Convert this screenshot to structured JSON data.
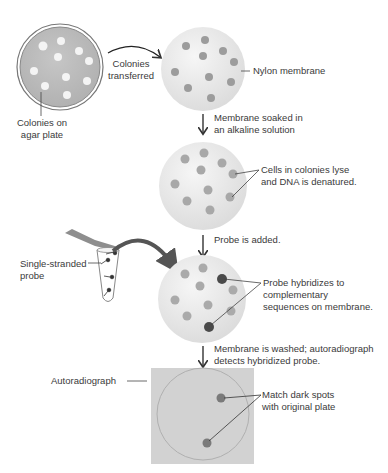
{
  "labels": {
    "agar_plate": [
      "Colonies on",
      "agar plate"
    ],
    "transfer": [
      "Colonies",
      "transferred"
    ],
    "nylon": "Nylon membrane",
    "step_soak": [
      "Membrane soaked in",
      "an alkaline solution"
    ],
    "lyse": [
      "Cells in colonies lyse",
      "and DNA is denatured."
    ],
    "step_probe": "Probe is added.",
    "probe": [
      "Single-stranded",
      "probe"
    ],
    "hybridize": [
      "Probe hybridizes to",
      "complementary",
      "sequences on membrane."
    ],
    "step_wash": [
      "Membrane is washed; autoradiograph",
      "detects hybridized probe."
    ],
    "autoradiograph": "Autoradiograph",
    "match": [
      "Match dark spots",
      "with original plate"
    ]
  },
  "colors": {
    "plate_fill": "#b9b9b9",
    "plate_rim": "#777777",
    "colony_white": "#f4f4f4",
    "membrane_fill": "#e6e6e6",
    "membrane_dot": "#9a9a9a",
    "hybrid_dot": "#555555",
    "autorad_bg": "#d2d2d2",
    "arrow": "#555555"
  },
  "steps": [
    {
      "stage": "agar plate",
      "colonies": 10
    },
    {
      "stage": "nylon membrane",
      "colonies": 10
    },
    {
      "stage": "denatured membrane",
      "colonies": 10
    },
    {
      "stage": "probe hybridized",
      "hybridized_spots": 2
    },
    {
      "stage": "autoradiograph",
      "dark_spots": 2
    }
  ]
}
